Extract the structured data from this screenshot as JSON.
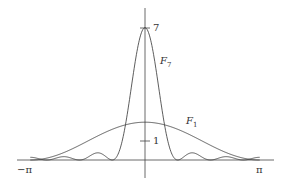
{
  "chart_data": {
    "type": "line",
    "title": "",
    "xlabel": "",
    "ylabel": "",
    "xlim": [
      -3.14159,
      3.14159
    ],
    "ylim": [
      0,
      7
    ],
    "grid": false,
    "legend": "inline labels",
    "x_tick_labels": [
      "−π",
      "π"
    ],
    "y_tick_labels": [
      "1",
      "7"
    ],
    "series": [
      {
        "name": "F_7",
        "label_main": "F",
        "label_sub": "7",
        "formula": "(1/7)·(sin(7x/2)/sin(x/2))^2",
        "peak": 7,
        "x": [
          -3.14,
          -2.69,
          -1.8,
          -0.9,
          -0.45,
          0,
          0.45,
          0.9,
          1.8,
          2.69,
          3.14
        ],
        "values": [
          0.14,
          0.0,
          0.0,
          0.0,
          3.5,
          7,
          3.5,
          0.0,
          0.0,
          0.0,
          0.14
        ]
      },
      {
        "name": "F_1",
        "label_main": "F",
        "label_sub": "1",
        "formula": "1 + cos x",
        "peak": 2,
        "x": [
          -3.14,
          -1.57,
          0,
          1.57,
          3.14
        ],
        "values": [
          0,
          1,
          2,
          1,
          0
        ]
      }
    ]
  },
  "labels": {
    "neg_pi": "−π",
    "pos_pi": "π",
    "tick_1": "1",
    "tick_7": "7",
    "f7_main": "F",
    "f7_sub": "7",
    "f1_main": "F",
    "f1_sub": "1"
  },
  "style": {
    "line_color": "#333333",
    "axis_color": "#444444"
  }
}
